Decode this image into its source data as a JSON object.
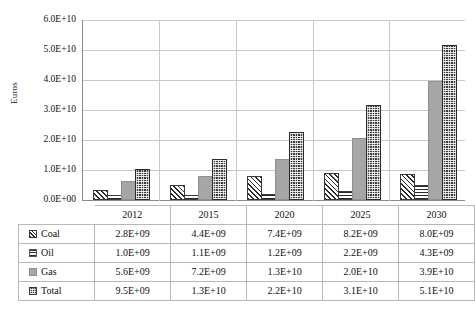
{
  "chart_data": {
    "type": "bar",
    "title": "",
    "xlabel": "",
    "ylabel": "Euros",
    "categories": [
      "2012",
      "2015",
      "2020",
      "2025",
      "2030"
    ],
    "ylim": [
      0,
      60000000000
    ],
    "ytick_labels": [
      "0.0E+00",
      "1.0E+10",
      "2.0E+10",
      "3.0E+10",
      "4.0E+10",
      "5.0E+10",
      "6.0E+10"
    ],
    "ytick_values": [
      0,
      10000000000,
      20000000000,
      30000000000,
      40000000000,
      50000000000,
      60000000000
    ],
    "grid": true,
    "legend_position": "table-row-labels",
    "series": [
      {
        "name": "Coal",
        "pattern": "diagonal-hatch",
        "values": [
          2800000000,
          4400000000,
          7400000000,
          8200000000,
          8000000000
        ],
        "labels": [
          "2.8E+09",
          "4.4E+09",
          "7.4E+09",
          "8.2E+09",
          "8.0E+09"
        ]
      },
      {
        "name": "Oil",
        "pattern": "horizontal-lines",
        "values": [
          1000000000,
          1100000000,
          1200000000,
          2200000000,
          4300000000
        ],
        "labels": [
          "1.0E+09",
          "1.1E+09",
          "1.2E+09",
          "2.2E+09",
          "4.3E+09"
        ]
      },
      {
        "name": "Gas",
        "pattern": "solid-gray",
        "values": [
          5600000000,
          7200000000,
          13000000000,
          20000000000,
          39000000000
        ],
        "labels": [
          "5.6E+09",
          "7.2E+09",
          "1.3E+10",
          "2.0E+10",
          "3.9E+10"
        ]
      },
      {
        "name": "Total",
        "pattern": "dense-dotted",
        "values": [
          9500000000,
          13000000000,
          22000000000,
          31000000000,
          51000000000
        ],
        "labels": [
          "9.5E+09",
          "1.3E+10",
          "2.2E+10",
          "3.1E+10",
          "5.1E+10"
        ]
      }
    ]
  },
  "axis": {
    "ylabel": "Euros",
    "yticks": [
      "6.0E+10",
      "5.0E+10",
      "4.0E+10",
      "3.0E+10",
      "2.0E+10",
      "1.0E+10",
      "0.0E+00"
    ]
  },
  "table": {
    "column_headers": [
      "2012",
      "2015",
      "2020",
      "2025",
      "2030"
    ],
    "rows": [
      {
        "label": "Coal",
        "swatch": "coal-swatch-icon",
        "values": [
          "2.8E+09",
          "4.4E+09",
          "7.4E+09",
          "8.2E+09",
          "8.0E+09"
        ]
      },
      {
        "label": "Oil",
        "swatch": "oil-swatch-icon",
        "values": [
          "1.0E+09",
          "1.1E+09",
          "1.2E+09",
          "2.2E+09",
          "4.3E+09"
        ]
      },
      {
        "label": "Gas",
        "swatch": "gas-swatch-icon",
        "values": [
          "5.6E+09",
          "7.2E+09",
          "1.3E+10",
          "2.0E+10",
          "3.9E+10"
        ]
      },
      {
        "label": "Total",
        "swatch": "total-swatch-icon",
        "values": [
          "9.5E+09",
          "1.3E+10",
          "2.2E+10",
          "3.1E+10",
          "5.1E+10"
        ]
      }
    ]
  },
  "caption": "",
  "colors": {
    "gas": "#a6a6a6",
    "total": "#3b3b3b",
    "grid": "#c9c9c9",
    "axis": "#8a8a8a",
    "text": "#111111"
  }
}
